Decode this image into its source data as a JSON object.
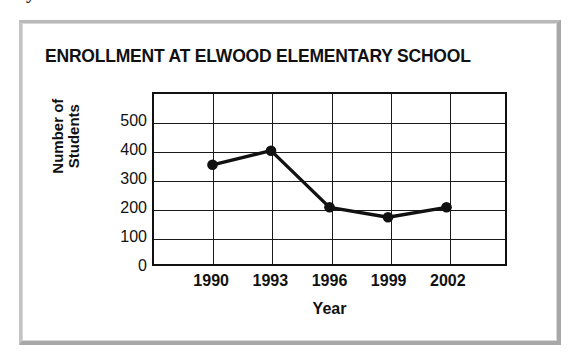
{
  "page": {
    "clipped_top_text": "years from 1990 to 2002."
  },
  "card": {
    "frame_color": "#b0b0b0",
    "background": "#ffffff"
  },
  "chart_data": {
    "type": "line",
    "title": "ENROLLMENT AT ELWOOD ELEMENTARY SCHOOL",
    "xlabel": "Year",
    "ylabel": "Number of Students",
    "categories": [
      "1990",
      "1993",
      "1996",
      "1999",
      "2002"
    ],
    "values": [
      350,
      400,
      200,
      165,
      200
    ],
    "points": [
      {
        "x": "1990",
        "y": 350
      },
      {
        "x": "1993",
        "y": 400
      },
      {
        "x": "1996",
        "y": 200
      },
      {
        "x": "1999",
        "y": 165
      },
      {
        "x": "2002",
        "y": 200
      }
    ],
    "ylim": [
      0,
      600
    ],
    "ytick_labels": [
      "500",
      "400",
      "300",
      "200",
      "100",
      "0"
    ],
    "ytick_values": [
      500,
      400,
      300,
      200,
      100,
      0
    ],
    "ytick_step": 100,
    "xtick_labels": [
      "1990",
      "1993",
      "1996",
      "1999",
      "2002"
    ],
    "x_columns": 6,
    "grid": true,
    "legend": "none",
    "line_color": "#111111",
    "marker_color": "#111111",
    "marker_shape": "circle",
    "grid_color": "#1a1a1a",
    "axis_color": "#111111"
  }
}
